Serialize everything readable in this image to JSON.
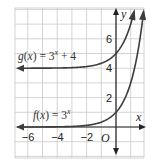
{
  "chart_data": {
    "type": "line",
    "title": "",
    "xlabel": "x",
    "ylabel": "y",
    "origin_label": "O",
    "xlim": [
      -7,
      2
    ],
    "ylim": [
      -2,
      8
    ],
    "grid": true,
    "x_ticks": [
      -6,
      -4,
      -2
    ],
    "y_ticks": [
      2,
      4,
      6
    ],
    "x_tick_labels": [
      "−6",
      "−4",
      "−2"
    ],
    "y_tick_labels": [
      "2",
      "4",
      "6"
    ],
    "series": [
      {
        "name": "f(x) = 3^x",
        "label_text": "f(x) = 3",
        "label_exp": "x",
        "label_name": "f",
        "formula": "3^x",
        "a": 3,
        "k": 0,
        "asymptote": 0,
        "points": [
          [
            -6,
            0.001
          ],
          [
            -4,
            0.012
          ],
          [
            -2,
            0.111
          ],
          [
            -1,
            0.333
          ],
          [
            0,
            1
          ],
          [
            1,
            3
          ],
          [
            2,
            9
          ]
        ]
      },
      {
        "name": "g(x) = 3^x + 4",
        "label_text": "g(x) = 3",
        "label_exp": "x",
        "label_suffix": " + 4",
        "label_name": "g",
        "formula": "3^x + 4",
        "a": 3,
        "k": 4,
        "asymptote": 4,
        "points": [
          [
            -6,
            4.001
          ],
          [
            -4,
            4.012
          ],
          [
            -2,
            4.111
          ],
          [
            -1,
            4.333
          ],
          [
            0,
            5
          ],
          [
            1,
            7
          ],
          [
            2,
            13
          ]
        ]
      }
    ],
    "annotations": [
      "g(x) = 3^x + 4",
      "f(x) = 3^x"
    ]
  },
  "colors": {
    "curve": "#3d3d3d",
    "grid": "#c9c9c9",
    "axis": "#222222"
  }
}
